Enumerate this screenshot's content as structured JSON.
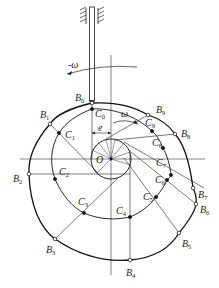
{
  "diagram": {
    "center_label": "O",
    "offset_label": "e",
    "omega_label": "ω",
    "neg_omega_label": "-ω",
    "profile_points": [
      {
        "name": "B",
        "sub": "0",
        "x": 92,
        "y": 103,
        "lx": 75,
        "ly": 101
      },
      {
        "name": "B",
        "sub": "1",
        "x": 50,
        "y": 124,
        "lx": 40,
        "ly": 118
      },
      {
        "name": "B",
        "sub": "2",
        "x": 29,
        "y": 174,
        "lx": 13,
        "ly": 182
      },
      {
        "name": "B",
        "sub": "3",
        "x": 55,
        "y": 239,
        "lx": 46,
        "ly": 253
      },
      {
        "name": "B",
        "sub": "4",
        "x": 130,
        "y": 260,
        "lx": 126,
        "ly": 276
      },
      {
        "name": "B",
        "sub": "5",
        "x": 179,
        "y": 233,
        "lx": 182,
        "ly": 247
      },
      {
        "name": "B",
        "sub": "6",
        "x": 196,
        "y": 204,
        "lx": 200,
        "ly": 213
      },
      {
        "name": "B",
        "sub": "7",
        "x": 193,
        "y": 188,
        "lx": 198,
        "ly": 198
      },
      {
        "name": "B",
        "sub": "8",
        "x": 175,
        "y": 134,
        "lx": 181,
        "ly": 137
      },
      {
        "name": "B",
        "sub": "9",
        "x": 148,
        "y": 115,
        "lx": 156,
        "ly": 113
      }
    ],
    "pitch_points": [
      {
        "name": "C",
        "sub": "0",
        "x": 92,
        "y": 109,
        "lx": 95,
        "ly": 117
      },
      {
        "name": "C",
        "sub": "1",
        "x": 59,
        "y": 133,
        "lx": 65,
        "ly": 138
      },
      {
        "name": "C",
        "sub": "2",
        "x": 55,
        "y": 179,
        "lx": 59,
        "ly": 175
      },
      {
        "name": "C",
        "sub": "3",
        "x": 84,
        "y": 213,
        "lx": 78,
        "ly": 205
      },
      {
        "name": "C",
        "sub": "4",
        "x": 130,
        "y": 217,
        "lx": 116,
        "ly": 214
      },
      {
        "name": "C",
        "sub": "5",
        "x": 156,
        "y": 197,
        "lx": 143,
        "ly": 200
      },
      {
        "name": "C",
        "sub": "6",
        "x": 167,
        "y": 180,
        "lx": 155,
        "ly": 183
      },
      {
        "name": "C",
        "sub": "7",
        "x": 171,
        "y": 175,
        "lx": 156,
        "ly": 166
      },
      {
        "name": "C",
        "sub": "8",
        "x": 163,
        "y": 148,
        "lx": 152,
        "ly": 146
      },
      {
        "name": "C",
        "sub": "9",
        "x": 152,
        "y": 131,
        "lx": 145,
        "ly": 126
      }
    ]
  }
}
